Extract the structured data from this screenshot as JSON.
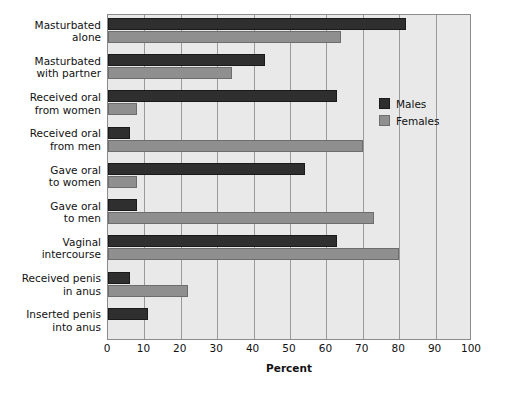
{
  "chart_data": {
    "type": "bar",
    "orientation": "horizontal",
    "title": "",
    "xlabel": "Percent",
    "ylabel": "",
    "xlim": [
      0,
      100
    ],
    "xticks": [
      0,
      10,
      20,
      30,
      40,
      50,
      60,
      70,
      80,
      90,
      100
    ],
    "grid": true,
    "legend_position": "inside-right",
    "categories": [
      "Masturbated alone",
      "Masturbated with partner",
      "Received oral from women",
      "Received oral from men",
      "Gave oral to women",
      "Gave oral to men",
      "Vaginal intercourse",
      "Received penis in anus",
      "Inserted penis into anus"
    ],
    "category_lines": [
      [
        "Masturbated",
        "alone"
      ],
      [
        "Masturbated",
        "with partner"
      ],
      [
        "Received oral",
        "from women"
      ],
      [
        "Received oral",
        "from men"
      ],
      [
        "Gave oral",
        "to women"
      ],
      [
        "Gave oral",
        "to men"
      ],
      [
        "Vaginal",
        "intercourse"
      ],
      [
        "Received penis",
        "in anus"
      ],
      [
        "Inserted penis",
        "into anus"
      ]
    ],
    "series": [
      {
        "name": "Males",
        "color": "#2f2f2f",
        "values": [
          82,
          43,
          63,
          6,
          54,
          8,
          63,
          6,
          11
        ]
      },
      {
        "name": "Females",
        "color": "#8f8f8f",
        "values": [
          64,
          34,
          8,
          70,
          8,
          73,
          80,
          22,
          0
        ]
      }
    ]
  },
  "legend": {
    "items": [
      {
        "label": "Males",
        "color": "#2f2f2f"
      },
      {
        "label": "Females",
        "color": "#8f8f8f"
      }
    ]
  },
  "axis": {
    "x_title": "Percent",
    "tick_labels": [
      "0",
      "10",
      "20",
      "30",
      "40",
      "50",
      "60",
      "70",
      "80",
      "90",
      "100"
    ]
  },
  "colors": {
    "plot_background": "#e9e9e9",
    "page_background": "#ffffff",
    "gridline": "#9a9a9a",
    "frame": "#8b8b8b",
    "text": "#111111",
    "males": "#2f2f2f",
    "females": "#8f8f8f"
  }
}
